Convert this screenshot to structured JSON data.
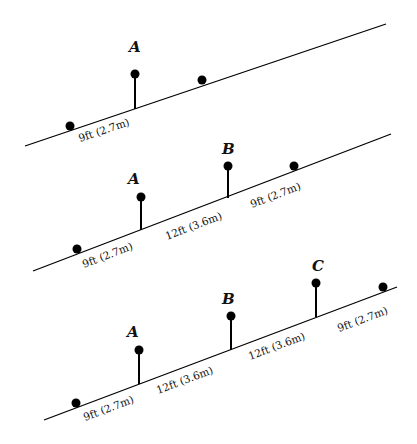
{
  "diagram": {
    "panels": [
      {
        "name": "one-post",
        "posts": [
          {
            "label": "A"
          }
        ],
        "distances": [
          "9ft (2.7m)"
        ]
      },
      {
        "name": "two-posts",
        "posts": [
          {
            "label": "A"
          },
          {
            "label": "B"
          }
        ],
        "distances": [
          "9ft (2.7m)",
          "12ft (3.6m)",
          "9ft (2.7m)"
        ]
      },
      {
        "name": "three-posts",
        "posts": [
          {
            "label": "A"
          },
          {
            "label": "B"
          },
          {
            "label": "C"
          }
        ],
        "distances": [
          "9ft (2.7m)",
          "12ft (3.6m)",
          "12ft (3.6m)",
          "9ft (2.7m)"
        ]
      }
    ]
  }
}
